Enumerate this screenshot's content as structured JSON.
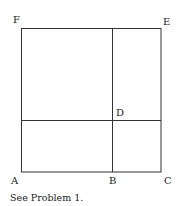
{
  "figure": {
    "labels": {
      "A": "A",
      "B": "B",
      "C": "C",
      "D": "D",
      "E": "E",
      "F": "F"
    },
    "caption": "See Problem 1.",
    "line_color": "#333333"
  }
}
